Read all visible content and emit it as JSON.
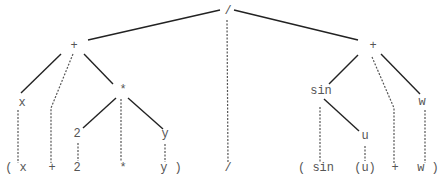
{
  "diagram": {
    "type": "parse-tree",
    "expression": "(x + 2 * y) / (sin (u) + w)",
    "nodes": [
      {
        "id": "root",
        "label": "/",
        "x": 228,
        "y": 14
      },
      {
        "id": "plusL",
        "label": "+",
        "x": 74,
        "y": 49
      },
      {
        "id": "plusR",
        "label": "+",
        "x": 373,
        "y": 49
      },
      {
        "id": "x",
        "label": "x",
        "x": 22,
        "y": 106
      },
      {
        "id": "times",
        "label": "*",
        "x": 123,
        "y": 93
      },
      {
        "id": "two",
        "label": "2",
        "x": 77,
        "y": 137
      },
      {
        "id": "y",
        "label": "y",
        "x": 165,
        "y": 137
      },
      {
        "id": "sin",
        "label": "sin",
        "x": 321,
        "y": 94
      },
      {
        "id": "w",
        "label": "w",
        "x": 422,
        "y": 105
      },
      {
        "id": "u",
        "label": "u",
        "x": 365,
        "y": 139
      }
    ],
    "tokens": [
      {
        "id": "tok-lparen-x",
        "label": "( x",
        "x": 16,
        "y": 171
      },
      {
        "id": "tok-plus1",
        "label": "+",
        "x": 52,
        "y": 171
      },
      {
        "id": "tok-2",
        "label": "2",
        "x": 77,
        "y": 171
      },
      {
        "id": "tok-times",
        "label": "*",
        "x": 123,
        "y": 171
      },
      {
        "id": "tok-y-rparen",
        "label": "y )",
        "x": 171,
        "y": 171
      },
      {
        "id": "tok-div",
        "label": "/",
        "x": 228,
        "y": 171
      },
      {
        "id": "tok-lparen-sin",
        "label": "( sin",
        "x": 316,
        "y": 171
      },
      {
        "id": "tok-u",
        "label": "(u)",
        "x": 365,
        "y": 171
      },
      {
        "id": "tok-plus2",
        "label": "+",
        "x": 395,
        "y": 171
      },
      {
        "id": "tok-w-rparen",
        "label": "w )",
        "x": 428,
        "y": 171
      }
    ],
    "solid_edges": [
      {
        "from": "root",
        "to": "plusL",
        "x1": 220,
        "y1": 10,
        "x2": 88,
        "y2": 40
      },
      {
        "from": "root",
        "to": "plusR",
        "x1": 234,
        "y1": 10,
        "x2": 358,
        "y2": 40
      },
      {
        "from": "plusL",
        "to": "x",
        "x1": 61,
        "y1": 54,
        "x2": 21,
        "y2": 93
      },
      {
        "from": "plusL",
        "to": "times",
        "x1": 84,
        "y1": 54,
        "x2": 113,
        "y2": 84
      },
      {
        "from": "times",
        "to": "two",
        "x1": 116,
        "y1": 98,
        "x2": 83,
        "y2": 128
      },
      {
        "from": "times",
        "to": "y",
        "x1": 128,
        "y1": 98,
        "x2": 163,
        "y2": 129
      },
      {
        "from": "plusR",
        "to": "sin",
        "x1": 358,
        "y1": 55,
        "x2": 329,
        "y2": 84
      },
      {
        "from": "plusR",
        "to": "w",
        "x1": 381,
        "y1": 54,
        "x2": 420,
        "y2": 94
      },
      {
        "from": "sin",
        "to": "u",
        "x1": 324,
        "y1": 99,
        "x2": 359,
        "y2": 131
      }
    ],
    "dashed_edges": [
      {
        "to": "tok-lparen-x",
        "points": "18,110 18,163"
      },
      {
        "to": "tok-plus1",
        "points": "73,54 51,108 51,163"
      },
      {
        "to": "tok-2",
        "points": "78,143 78,161"
      },
      {
        "to": "tok-times",
        "points": "121,99 121,161"
      },
      {
        "to": "tok-y-rparen",
        "points": "165,144 165,162"
      },
      {
        "to": "tok-div",
        "points": "227,20 228,163"
      },
      {
        "to": "tok-lparen-sin",
        "points": "320,107 320,163"
      },
      {
        "to": "tok-u",
        "points": "365,146 365,161"
      },
      {
        "to": "tok-plus2",
        "points": "372,57 394,108 394,164"
      },
      {
        "to": "tok-w-rparen",
        "points": "425,110 425,163"
      }
    ]
  }
}
